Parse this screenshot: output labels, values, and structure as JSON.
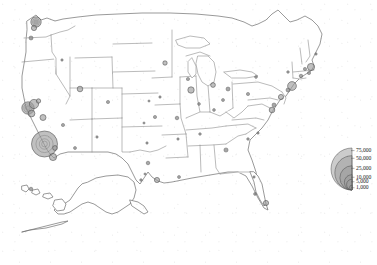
{
  "figure": {
    "title": "",
    "width": 377,
    "height": 265,
    "background_color": "#ffffff",
    "border_color": "#8d8d8d",
    "symbol_fill": "#9a9a9a",
    "symbol_stroke": "#4a4a4a"
  },
  "chart_data": {
    "type": "scatter",
    "subtype": "proportional-symbol-map",
    "title": "",
    "subtitle": "",
    "xlabel": "",
    "ylabel": "",
    "region": "United States",
    "projection_note": "Lower 48 with Alaska and Hawaii insets",
    "grid": false,
    "legend_position": "bottom-right",
    "value_unit": "count",
    "legend": {
      "title": "",
      "style": "nested-semicircles",
      "breaks": [
        75000,
        50000,
        25000,
        10000,
        5000,
        1000
      ],
      "labels": [
        "75,000",
        "50,000",
        "25,000",
        "10,000",
        "5,000",
        "1,000"
      ]
    },
    "points": [
      {
        "name": "Los Angeles CA",
        "x": 44.5,
        "y": 144.0,
        "r": 13.0,
        "value": 75000
      },
      {
        "name": "San Francisco Bay CA",
        "x": 28.0,
        "y": 108.0,
        "r": 6.2,
        "value": 22000
      },
      {
        "name": "Oakland CA",
        "x": 34.0,
        "y": 104.0,
        "r": 4.6,
        "value": 13000
      },
      {
        "name": "San Jose CA",
        "x": 31.5,
        "y": 113.5,
        "r": 3.4,
        "value": 8000
      },
      {
        "name": "Sacramento CA",
        "x": 38.5,
        "y": 101.0,
        "r": 2.2,
        "value": 4000
      },
      {
        "name": "Fresno CA",
        "x": 43.0,
        "y": 117.5,
        "r": 3.0,
        "value": 6000
      },
      {
        "name": "San Diego CA",
        "x": 53.0,
        "y": 157.0,
        "r": 3.6,
        "value": 9000
      },
      {
        "name": "Riverside CA",
        "x": 55.0,
        "y": 148.0,
        "r": 2.4,
        "value": 4500
      },
      {
        "name": "Seattle WA",
        "x": 36.0,
        "y": 22.0,
        "r": 5.2,
        "value": 17000
      },
      {
        "name": "Tacoma WA",
        "x": 34.0,
        "y": 28.0,
        "r": 2.6,
        "value": 5000
      },
      {
        "name": "Portland OR",
        "x": 31.0,
        "y": 38.0,
        "r": 2.0,
        "value": 3500
      },
      {
        "name": "Salt Lake City UT",
        "x": 80.0,
        "y": 89.0,
        "r": 2.8,
        "value": 5500
      },
      {
        "name": "Las Vegas NV",
        "x": 63.0,
        "y": 125.0,
        "r": 1.6,
        "value": 2000
      },
      {
        "name": "Phoenix AZ",
        "x": 75.0,
        "y": 148.0,
        "r": 1.5,
        "value": 1800
      },
      {
        "name": "Denver CO",
        "x": 108.0,
        "y": 102.0,
        "r": 1.6,
        "value": 2000
      },
      {
        "name": "Boise ID",
        "x": 62.0,
        "y": 60.0,
        "r": 1.2,
        "value": 1200
      },
      {
        "name": "Albuquerque NM",
        "x": 97.0,
        "y": 137.0,
        "r": 1.2,
        "value": 1200
      },
      {
        "name": "Dallas TX",
        "x": 148.0,
        "y": 163.0,
        "r": 1.8,
        "value": 2500
      },
      {
        "name": "Houston TX",
        "x": 157.0,
        "y": 180.0,
        "r": 2.6,
        "value": 5000
      },
      {
        "name": "San Antonio TX",
        "x": 141.0,
        "y": 180.0,
        "r": 1.3,
        "value": 1300
      },
      {
        "name": "Austin TX",
        "x": 145.0,
        "y": 174.0,
        "r": 1.1,
        "value": 1100
      },
      {
        "name": "Oklahoma City OK",
        "x": 147.0,
        "y": 143.0,
        "r": 1.2,
        "value": 1200
      },
      {
        "name": "Wichita KS",
        "x": 144.0,
        "y": 123.0,
        "r": 1.1,
        "value": 1000
      },
      {
        "name": "Omaha NE",
        "x": 149.0,
        "y": 101.0,
        "r": 1.1,
        "value": 1000
      },
      {
        "name": "Minneapolis MN",
        "x": 165.0,
        "y": 63.0,
        "r": 2.2,
        "value": 4000
      },
      {
        "name": "Des Moines IA",
        "x": 160.0,
        "y": 97.0,
        "r": 1.2,
        "value": 1200
      },
      {
        "name": "Kansas City MO",
        "x": 155.0,
        "y": 117.0,
        "r": 1.6,
        "value": 2000
      },
      {
        "name": "St Louis MO",
        "x": 177.0,
        "y": 118.0,
        "r": 1.8,
        "value": 2400
      },
      {
        "name": "Chicago IL",
        "x": 191.0,
        "y": 90.0,
        "r": 3.2,
        "value": 7500
      },
      {
        "name": "Milwaukee WI",
        "x": 188.0,
        "y": 79.0,
        "r": 1.6,
        "value": 2000
      },
      {
        "name": "Detroit MI",
        "x": 213.0,
        "y": 85.0,
        "r": 2.4,
        "value": 4500
      },
      {
        "name": "Indianapolis IN",
        "x": 199.0,
        "y": 104.0,
        "r": 1.4,
        "value": 1600
      },
      {
        "name": "Columbus OH",
        "x": 223.0,
        "y": 100.0,
        "r": 1.5,
        "value": 1800
      },
      {
        "name": "Cleveland OH",
        "x": 228.0,
        "y": 89.0,
        "r": 2.0,
        "value": 3000
      },
      {
        "name": "Cincinnati OH",
        "x": 214.0,
        "y": 110.0,
        "r": 1.4,
        "value": 1600
      },
      {
        "name": "Nashville TN",
        "x": 200.0,
        "y": 134.0,
        "r": 1.3,
        "value": 1400
      },
      {
        "name": "Memphis TN",
        "x": 178.0,
        "y": 139.0,
        "r": 1.2,
        "value": 1200
      },
      {
        "name": "New Orleans LA",
        "x": 179.0,
        "y": 177.0,
        "r": 1.5,
        "value": 1800
      },
      {
        "name": "Atlanta GA",
        "x": 226.0,
        "y": 150.0,
        "r": 2.1,
        "value": 3600
      },
      {
        "name": "Charlotte NC",
        "x": 248.0,
        "y": 139.0,
        "r": 1.3,
        "value": 1400
      },
      {
        "name": "Raleigh NC",
        "x": 258.0,
        "y": 133.0,
        "r": 1.2,
        "value": 1200
      },
      {
        "name": "Miami FL",
        "x": 266.0,
        "y": 203.0,
        "r": 2.6,
        "value": 5200
      },
      {
        "name": "Tampa FL",
        "x": 255.0,
        "y": 194.0,
        "r": 1.4,
        "value": 1600
      },
      {
        "name": "Jacksonville FL",
        "x": 254.0,
        "y": 177.0,
        "r": 1.2,
        "value": 1200
      },
      {
        "name": "Washington DC",
        "x": 272.0,
        "y": 110.0,
        "r": 2.8,
        "value": 5800
      },
      {
        "name": "Baltimore MD",
        "x": 274.0,
        "y": 105.0,
        "r": 2.0,
        "value": 3000
      },
      {
        "name": "Philadelphia PA",
        "x": 281.0,
        "y": 97.0,
        "r": 2.6,
        "value": 5000
      },
      {
        "name": "Pittsburgh PA",
        "x": 248.0,
        "y": 94.0,
        "r": 1.6,
        "value": 2000
      },
      {
        "name": "Newark NJ",
        "x": 288.0,
        "y": 90.0,
        "r": 2.0,
        "value": 3000
      },
      {
        "name": "New York NY",
        "x": 292.0,
        "y": 86.0,
        "r": 4.4,
        "value": 12000
      },
      {
        "name": "Hartford CT",
        "x": 301.0,
        "y": 76.0,
        "r": 1.8,
        "value": 2400
      },
      {
        "name": "Providence RI",
        "x": 309.0,
        "y": 73.0,
        "r": 1.6,
        "value": 2000
      },
      {
        "name": "Boston MA",
        "x": 311.0,
        "y": 67.0,
        "r": 3.6,
        "value": 9000
      },
      {
        "name": "Worcester MA",
        "x": 305.0,
        "y": 69.0,
        "r": 1.6,
        "value": 2000
      },
      {
        "name": "Albany NY",
        "x": 288.0,
        "y": 72.0,
        "r": 1.3,
        "value": 1400
      },
      {
        "name": "Buffalo NY",
        "x": 256.0,
        "y": 77.0,
        "r": 1.4,
        "value": 1600
      },
      {
        "name": "Portland ME",
        "x": 316.0,
        "y": 54.0,
        "r": 1.2,
        "value": 1200
      },
      {
        "name": "Honolulu HI",
        "x": 31.0,
        "y": 189.0,
        "r": 1.8,
        "value": 2400
      }
    ]
  }
}
